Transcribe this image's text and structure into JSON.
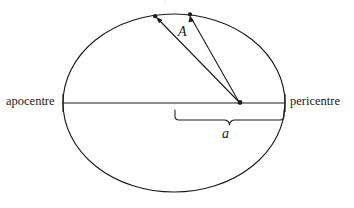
{
  "figure": {
    "type": "orbital-ellipse-diagram",
    "cropped_caption_fragment": "Kepler's second law",
    "labels": {
      "apocentre": "apocentre",
      "pericentre": "pericentre",
      "swept_area": "A",
      "semi_major_axis": "a"
    },
    "colors": {
      "stroke": "#1a1a1a",
      "background": "#ffffff",
      "text": "#1a1a1a"
    },
    "geometry": {
      "ellipse_center_x": 174,
      "ellipse_center_y": 103,
      "ellipse_rx": 111,
      "ellipse_ry": 89,
      "focus_x": 240,
      "focus_y": 103,
      "orbit_point_1_x": 155,
      "orbit_point_1_y": 16,
      "orbit_point_2_x": 190,
      "orbit_point_2_y": 14,
      "brace_left_x": 175,
      "brace_right_x": 284,
      "brace_y": 110,
      "major_axis_left_x": 63,
      "major_axis_right_x": 285
    }
  }
}
